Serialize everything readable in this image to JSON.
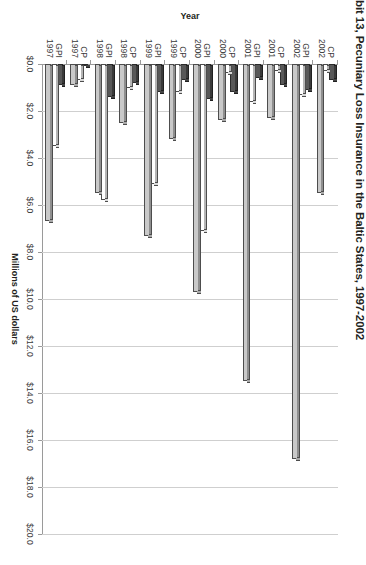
{
  "chart": {
    "title": "bit 13, Pecuniary Loss Insurance in the Baltic States, 1997-2002",
    "value_axis_title": "Millions of US dollars",
    "category_axis_title": "Year"
  },
  "chart_data": {
    "type": "bar",
    "orientation": "horizontal",
    "title": "bit 13, Pecuniary Loss Insurance in the Baltic States, 1997-2002",
    "xlabel": "Millions of US dollars",
    "ylabel": "Year",
    "xlim": [
      0,
      20
    ],
    "grid": true,
    "legend": "none",
    "tick_labels": [
      "$0.0",
      "$2.0",
      "$4.0",
      "$6.0",
      "$8.0",
      "$10.0",
      "$12.0",
      "$14.0",
      "$16.0",
      "$18.0",
      "$20.0"
    ],
    "tick_values": [
      0,
      2,
      4,
      6,
      8,
      10,
      12,
      14,
      16,
      18,
      20
    ],
    "categories": [
      "GPI 1997",
      "CP 1997",
      "GPI 1998",
      "CP 1998",
      "GPI 1999",
      "CP 1999",
      "GPI 2000",
      "CP 2000",
      "GPI 2001",
      "CP 2001",
      "GPI 2002",
      "CP 2002"
    ],
    "category_lines": [
      [
        "GPI",
        "1997"
      ],
      [
        "CP",
        "1997"
      ],
      [
        "GPI",
        "1998"
      ],
      [
        "CP",
        "1998"
      ],
      [
        "GPI",
        "1999"
      ],
      [
        "CP",
        "1999"
      ],
      [
        "GPI",
        "2000"
      ],
      [
        "CP",
        "2000"
      ],
      [
        "GPI",
        "2001"
      ],
      [
        "CP",
        "2001"
      ],
      [
        "GPI",
        "2002"
      ],
      [
        "CP",
        "2002"
      ]
    ],
    "series": [
      {
        "name": "Series 1",
        "color": "#c9c9c9",
        "values": [
          6.7,
          0.9,
          5.5,
          2.5,
          7.3,
          3.2,
          9.7,
          2.4,
          13.5,
          2.3,
          16.8,
          5.5
        ]
      },
      {
        "name": "Series 2",
        "color": "#ffffff",
        "values": [
          3.5,
          0.7,
          5.8,
          1.0,
          5.1,
          1.2,
          7.1,
          0.4,
          1.6,
          0.3,
          1.3,
          0.3
        ]
      },
      {
        "name": "Series 3",
        "color": "#585858",
        "values": [
          0.9,
          0.1,
          1.4,
          0.8,
          1.2,
          0.7,
          1.5,
          1.2,
          0.6,
          0.9,
          1.1,
          0.7
        ]
      }
    ]
  }
}
